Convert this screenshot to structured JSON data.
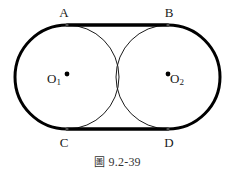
{
  "figure": {
    "caption_cjk": "圖",
    "caption_number": "9.2-39",
    "caption_full": "圖 9.2-39",
    "stroke_color": "#000000",
    "thin_stroke_color": "#1a1a1a",
    "background_color": "#ffffff",
    "label_color": "#1a1a1a",
    "outer_stroke_width": 3,
    "inner_stroke_width": 1
  },
  "labels": {
    "A": "A",
    "B": "B",
    "C": "C",
    "D": "D",
    "O1_letter": "O",
    "O1_sub": "1",
    "O2_letter": "O",
    "O2_sub": "2"
  },
  "geometry": {
    "circle1": {
      "cx": 67,
      "cy": 77,
      "r": 52
    },
    "circle2": {
      "cx": 168,
      "cy": 77,
      "r": 52
    },
    "tangent_top_y": 25,
    "tangent_bottom_y": 129,
    "point_A": {
      "x": 67,
      "y": 25
    },
    "point_B": {
      "x": 168,
      "y": 25
    },
    "point_C": {
      "x": 67,
      "y": 129
    },
    "point_D": {
      "x": 168,
      "y": 129
    }
  }
}
